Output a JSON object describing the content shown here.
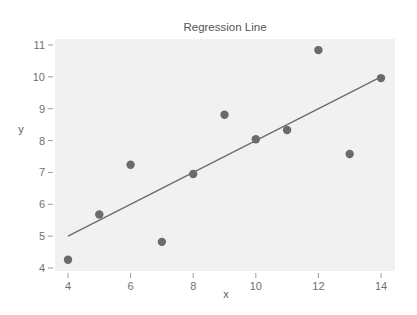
{
  "chart_data": {
    "type": "scatter",
    "title": "Regression Line",
    "xlabel": "x",
    "ylabel": "y",
    "xlim": [
      3.6,
      14.45
    ],
    "ylim": [
      3.9,
      11.2
    ],
    "x_ticks": [
      4,
      6,
      8,
      10,
      12,
      14
    ],
    "y_ticks": [
      4,
      5,
      6,
      7,
      8,
      9,
      10,
      11
    ],
    "grid": false,
    "legend": null,
    "series": [
      {
        "name": "data",
        "kind": "scatter",
        "color": "#6b6b6b",
        "x": [
          10,
          8,
          13,
          9,
          11,
          14,
          6,
          4,
          12,
          7,
          5
        ],
        "y": [
          8.04,
          6.95,
          7.58,
          8.81,
          8.33,
          9.96,
          7.24,
          4.26,
          10.84,
          4.82,
          5.68
        ]
      },
      {
        "name": "regression",
        "kind": "line",
        "color": "#6b6b6b",
        "x": [
          4,
          14
        ],
        "y": [
          5.0,
          10.0
        ]
      }
    ],
    "background": "#f1f1f1"
  }
}
